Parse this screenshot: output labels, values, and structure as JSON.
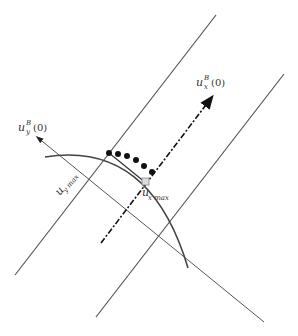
{
  "diagram": {
    "labels": {
      "ux_axis": {
        "base": "u",
        "sup": "B",
        "sub": "x",
        "arg": "(0)"
      },
      "uy_axis": {
        "base": "u",
        "sup": "B",
        "sub": "y",
        "arg": "(0)"
      },
      "uy_max": {
        "base": "u",
        "sub": "y max"
      },
      "ux_max": {
        "base": "u",
        "sub": "x max"
      }
    },
    "arc_points_count": 6,
    "colors": {
      "line": "#555555",
      "arc": "#444444",
      "dot": "#111111",
      "marker_fill": "#dddddd",
      "marker_stroke": "#888888"
    }
  }
}
